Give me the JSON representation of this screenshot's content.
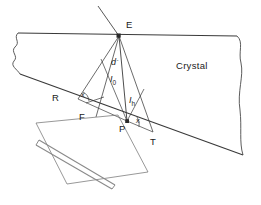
{
  "figure": {
    "type": "technical-line-diagram",
    "canvas": {
      "width": 261,
      "height": 205
    },
    "colors": {
      "line": "#3a3a3a",
      "crystal_fill": "#ffffff",
      "detector": "#8a8a8a",
      "text": "#1a1a1a",
      "background": "#ffffff"
    }
  },
  "labels": {
    "entrance_point": "E",
    "exit_point_left": "R",
    "foot_point": "F",
    "base_point": "P",
    "exit_point_right": "T",
    "region_crystal": "Crystal",
    "path_d_prime": "d",
    "path_d_prime_mark": "´",
    "beam_incident": "I",
    "beam_incident_sub": "0",
    "beam_diffracted": "I",
    "beam_diffracted_sub": "h",
    "angle_left": "x",
    "angle_right": "x"
  },
  "geometry": {
    "crystal_top_surface": {
      "from": [
        18,
        33
      ],
      "to": [
        237,
        36
      ]
    },
    "crystal_bottom_surface": {
      "from": [
        20,
        74
      ],
      "to": [
        243,
        155
      ]
    },
    "entrance_point_xy": [
      119,
      36
    ],
    "R_xy": [
      81,
      96
    ],
    "F_xy": [
      99,
      115
    ],
    "P_xy": [
      128,
      121
    ],
    "T_xy": [
      152,
      131
    ],
    "incident_ray": {
      "from": [
        99,
        7
      ],
      "to": [
        119,
        36
      ]
    },
    "rays_from_E": [
      {
        "name": "E-R",
        "to": [
          78,
          99
        ]
      },
      {
        "name": "E-F",
        "to": [
          97,
          117
        ]
      },
      {
        "name": "E-P",
        "to": [
          127,
          122
        ]
      },
      {
        "name": "E-T",
        "to": [
          153,
          132
        ]
      }
    ],
    "detector_plate": {
      "from": [
        37,
        147
      ],
      "to": [
        113,
        192
      ]
    },
    "detector_frame": [
      [
        36,
        123
      ],
      [
        118,
        115
      ],
      [
        148,
        172
      ],
      [
        67,
        184
      ]
    ]
  },
  "annotations": {
    "arc_angle_left_center": [
      81,
      96
    ],
    "arc_angle_right_center": [
      128,
      121
    ],
    "entrance_marker": "filled-square",
    "base_marker": "filled-square"
  }
}
